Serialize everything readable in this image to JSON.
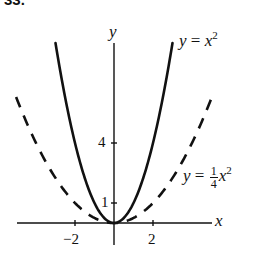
{
  "figure": {
    "number_label": "33."
  },
  "chart_data": {
    "type": "line",
    "title": "",
    "xlabel": "x",
    "ylabel": "y",
    "xlim": [
      -5.1,
      5.1
    ],
    "ylim": [
      -1.1,
      9
    ],
    "grid": false,
    "x_ticks": [
      -2,
      2
    ],
    "x_tick_labels": [
      "−2",
      "2"
    ],
    "y_ticks": [
      1,
      4
    ],
    "y_tick_labels": [
      "1",
      "4"
    ],
    "series": [
      {
        "name": "y = x^2",
        "style": "solid",
        "equation": "y = x^2",
        "x": [
          -3,
          -2.5,
          -2,
          -1.5,
          -1,
          -0.5,
          0,
          0.5,
          1,
          1.5,
          2,
          2.5,
          3
        ],
        "y": [
          9,
          6.25,
          4,
          2.25,
          1,
          0.25,
          0,
          0.25,
          1,
          2.25,
          4,
          6.25,
          9
        ]
      },
      {
        "name": "y = 1/4 x^2",
        "style": "dashed",
        "equation": "y = (1/4) x^2",
        "x": [
          -5,
          -4,
          -3,
          -2,
          -1,
          0,
          1,
          2,
          3,
          4,
          5
        ],
        "y": [
          6.25,
          4,
          2.25,
          1,
          0.25,
          0,
          0.25,
          1,
          2.25,
          4,
          6.25
        ]
      }
    ],
    "annotations": [
      {
        "text": "y = x²",
        "near_series": "y = x^2",
        "position": "upper right end of solid curve"
      },
      {
        "text": "y = ¼x²",
        "near_series": "y = 1/4 x^2",
        "position": "right of dashed curve"
      }
    ]
  },
  "labels": {
    "x_axis": "x",
    "y_axis": "y",
    "tick_x_neg2": "−2",
    "tick_x_2": "2",
    "tick_y_1": "1",
    "tick_y_4": "4",
    "curve1": {
      "lhs": "y",
      "eq": " = ",
      "var": "x",
      "exp": "2"
    },
    "curve2": {
      "lhs": "y",
      "eq": " = ",
      "num": "1",
      "den": "4",
      "var": "x",
      "exp": "2"
    }
  }
}
